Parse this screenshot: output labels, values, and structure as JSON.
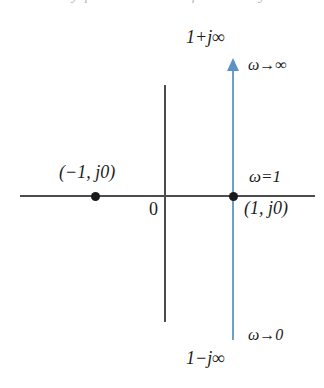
{
  "figure": {
    "name": "nyquist-contour-diagram",
    "background_color": "#ffffff",
    "clipped_header_sliver": "the Nyquist contour for the system",
    "axes": {
      "real_axis": {
        "name": "real-axis",
        "color": "#4d4b4b",
        "origin_label": "0"
      },
      "imaginary_axis": {
        "name": "imaginary-axis",
        "color": "#4d4b4b"
      }
    },
    "contour": {
      "name": "nyquist-path",
      "color": "#6d9fcd",
      "arrow_color": "#5b92c6",
      "direction": "upward",
      "top_endpoint_label": "1+j∞",
      "bottom_endpoint_label": "1−j∞",
      "top_frequency_label": "ω→∞",
      "bottom_frequency_label": "ω→0",
      "crossing_frequency_label": "ω=1"
    },
    "points": [
      {
        "name": "point-minus-one",
        "label": "(−1, j0)",
        "real": -1,
        "imag": 0,
        "color": "#1a1a1a"
      },
      {
        "name": "point-plus-one",
        "label": "(1, j0)",
        "real": 1,
        "imag": 0,
        "color": "#1a1a1a"
      }
    ]
  }
}
